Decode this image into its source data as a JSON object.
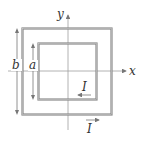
{
  "diagram": {
    "axes": {
      "x_label": "x",
      "y_label": "y"
    },
    "outer_loop": {
      "side_label": "b",
      "current_label": "I",
      "current_direction": "right (counterclockwise along bottom edge)"
    },
    "inner_loop": {
      "side_label": "a",
      "current_label": "I",
      "current_direction": "left (clockwise along bottom edge)"
    },
    "colors": {
      "loop_stroke": "#8a8a8a",
      "axis_stroke": "#9a9a9a",
      "text": "#333333"
    }
  }
}
